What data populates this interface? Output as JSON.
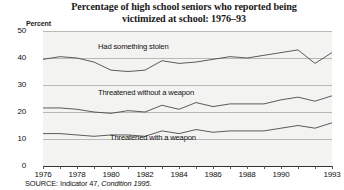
{
  "title": {
    "line1": "Percentage of high school seniors who reported being",
    "line2": "victimized at school:  1976–93"
  },
  "axis": {
    "y_unit_label": "Percent",
    "y_ticks": [
      "50",
      "40",
      "30",
      "20",
      "10",
      "0"
    ],
    "x_ticks_labeled": [
      "1976",
      "1978",
      "1980",
      "1982",
      "1984",
      "1986",
      "1988",
      "1990",
      "1993"
    ]
  },
  "series_labels": {
    "top": "Had something stolen",
    "middle": "Threatened without a weapon",
    "bottom": "Threatened with a weapon"
  },
  "source": {
    "prefix": "SOURCE:  Indicator 47, ",
    "italic": "Condition 1995",
    "suffix": "."
  },
  "colors": {
    "line": "#4a4a4a",
    "grid": "#b8b8b4",
    "plot_bg": "#f3f3f1",
    "axis": "#333333"
  },
  "chart_data": {
    "type": "line",
    "title": "Percentage of high school seniors who reported being victimized at school: 1976–93",
    "xlabel": "",
    "ylabel": "Percent",
    "ylim": [
      0,
      50
    ],
    "xlim": [
      1976,
      1993
    ],
    "grid": true,
    "legend": "inline-labels",
    "x": [
      1976,
      1977,
      1978,
      1979,
      1980,
      1981,
      1982,
      1983,
      1984,
      1985,
      1986,
      1987,
      1988,
      1989,
      1990,
      1991,
      1992,
      1993
    ],
    "series": [
      {
        "name": "Had something stolen",
        "values": [
          39.5,
          40.5,
          40.0,
          38.5,
          35.5,
          35.0,
          35.5,
          39.0,
          38.0,
          38.5,
          39.5,
          40.5,
          40.0,
          41.0,
          42.0,
          43.0,
          38.0,
          42.0
        ]
      },
      {
        "name": "Threatened without a weapon",
        "values": [
          21.5,
          21.5,
          21.0,
          20.0,
          19.5,
          20.5,
          20.0,
          22.5,
          21.0,
          23.5,
          22.0,
          23.0,
          23.0,
          23.0,
          24.5,
          25.5,
          24.0,
          26.0
        ]
      },
      {
        "name": "Threatened with a weapon",
        "values": [
          12.0,
          12.0,
          11.5,
          11.0,
          11.5,
          11.5,
          11.0,
          13.0,
          12.0,
          13.5,
          12.5,
          13.0,
          13.0,
          13.0,
          14.0,
          15.0,
          14.0,
          16.0
        ]
      }
    ]
  }
}
